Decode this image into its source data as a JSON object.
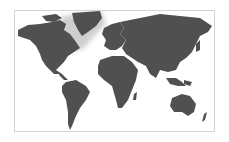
{
  "map": {
    "title": "World map",
    "land_color": "#505050",
    "ice_color": "#c8c8c8",
    "ocean_color": "#ffffff",
    "border_color": "#d4d4d4",
    "regions": [
      "North America",
      "Greenland",
      "South America",
      "Europe",
      "Africa",
      "Asia",
      "Australia",
      "New Zealand"
    ]
  }
}
